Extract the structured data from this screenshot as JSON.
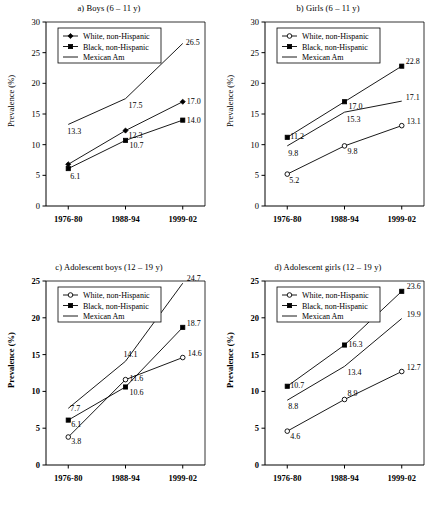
{
  "figure": {
    "ylabel": "Prevalence (%)",
    "xticks": [
      "1976-80",
      "1988-94",
      "1999-02"
    ],
    "legend": {
      "white": "White, non-Hispanic",
      "black": "Black, non-Hispanic",
      "mexican": "Mexican Am"
    }
  },
  "chart_data": [
    {
      "type": "line",
      "panel": "a",
      "title": "a) Boys (6 – 11 y)",
      "xlabel": "",
      "ylabel": "Prevalence (%)",
      "categories": [
        "1976-80",
        "1988-94",
        "1999-02"
      ],
      "ylim": [
        0,
        30
      ],
      "yticks": [
        0,
        5,
        10,
        15,
        20,
        25,
        30
      ],
      "grid": false,
      "legend_position": "top-left",
      "series": [
        {
          "name": "White, non-Hispanic",
          "marker": "filled-diamond",
          "values": [
            6.8,
            12.3,
            17.0
          ],
          "labels": [
            "",
            "12.3",
            "17.0"
          ]
        },
        {
          "name": "Black, non-Hispanic",
          "marker": "filled-square",
          "values": [
            6.1,
            10.7,
            14.0
          ],
          "labels": [
            "6.1",
            "10.7",
            "14.0"
          ]
        },
        {
          "name": "Mexican Am",
          "marker": "none",
          "values": [
            13.3,
            17.5,
            26.5
          ],
          "labels": [
            "13.3",
            "17.5",
            "26.5"
          ]
        }
      ]
    },
    {
      "type": "line",
      "panel": "b",
      "title": "b) Girls (6 – 11 y)",
      "xlabel": "",
      "ylabel": "Prevalence (%)",
      "categories": [
        "1976-80",
        "1988-94",
        "1999-02"
      ],
      "ylim": [
        0,
        30
      ],
      "yticks": [
        0,
        5,
        10,
        15,
        20,
        25,
        30
      ],
      "grid": false,
      "legend_position": "top-left",
      "series": [
        {
          "name": "White, non-Hispanic",
          "marker": "open-circle",
          "values": [
            5.2,
            9.8,
            13.1
          ],
          "labels": [
            "5.2",
            "9.8",
            "13.1"
          ]
        },
        {
          "name": "Black, non-Hispanic",
          "marker": "filled-square",
          "values": [
            11.2,
            17.0,
            22.8
          ],
          "labels": [
            "11.2",
            "17.0",
            "22.8"
          ]
        },
        {
          "name": "Mexican Am",
          "marker": "none",
          "values": [
            9.8,
            15.3,
            17.1
          ],
          "labels": [
            "9.8",
            "15.3",
            "17.1"
          ]
        }
      ]
    },
    {
      "type": "line",
      "panel": "c",
      "title": "c) Adolescent boys (12 – 19 y)",
      "xlabel": "",
      "ylabel": "Prevalence (%)",
      "categories": [
        "1976-80",
        "1988-94",
        "1999-02"
      ],
      "ylim": [
        0,
        25
      ],
      "yticks": [
        0,
        5,
        10,
        15,
        20,
        25
      ],
      "grid": false,
      "legend_position": "top-left",
      "series": [
        {
          "name": "White, non-Hispanic",
          "marker": "open-circle",
          "values": [
            3.8,
            11.6,
            14.6
          ],
          "labels": [
            "3.8",
            "11.6",
            "14.6"
          ]
        },
        {
          "name": "Black, non-Hispanic",
          "marker": "filled-square",
          "values": [
            6.1,
            10.6,
            18.7
          ],
          "labels": [
            "6.1",
            "10.6",
            "18.7"
          ]
        },
        {
          "name": "Mexican Am",
          "marker": "none",
          "values": [
            7.7,
            14.1,
            24.7
          ],
          "labels": [
            "7.7",
            "14.1",
            "24.7"
          ]
        }
      ]
    },
    {
      "type": "line",
      "panel": "d",
      "title": "d) Adolescent girls (12 – 19 y)",
      "xlabel": "",
      "ylabel": "Prevalence (%)",
      "categories": [
        "1976-80",
        "1988-94",
        "1999-02"
      ],
      "ylim": [
        0,
        25
      ],
      "yticks": [
        0,
        5,
        10,
        15,
        20,
        25
      ],
      "grid": false,
      "legend_position": "top-left",
      "series": [
        {
          "name": "White, non-Hispanic",
          "marker": "open-circle",
          "values": [
            4.6,
            8.9,
            12.7
          ],
          "labels": [
            "4.6",
            "8.9",
            "12.7"
          ]
        },
        {
          "name": "Black, non-Hispanic",
          "marker": "filled-square",
          "values": [
            10.7,
            16.3,
            23.6
          ],
          "labels": [
            "10.7",
            "16.3",
            "23.6"
          ]
        },
        {
          "name": "Mexican Am",
          "marker": "none",
          "values": [
            8.8,
            13.4,
            19.9
          ],
          "labels": [
            "8.8",
            "13.4",
            "19.9"
          ]
        }
      ]
    }
  ]
}
